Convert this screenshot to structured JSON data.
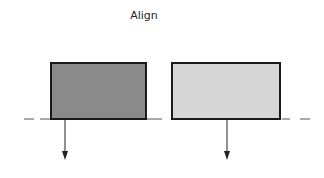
{
  "title": "Align",
  "diagram": {
    "baseline": {
      "y": 119,
      "x_start": 24,
      "x_end": 312,
      "style": "dashed"
    },
    "boxes": [
      {
        "name": "dark-box",
        "x": 51,
        "y": 63,
        "width": 95,
        "height": 56,
        "fill": "#8a8a8a",
        "stroke": "#1a1a1a"
      },
      {
        "name": "light-box",
        "x": 172,
        "y": 63,
        "width": 108,
        "height": 56,
        "fill": "#d6d6d6",
        "stroke": "#1a1a1a"
      }
    ],
    "arrows": [
      {
        "name": "left-arrow",
        "x": 65,
        "y1": 119,
        "y2": 160
      },
      {
        "name": "right-arrow",
        "x": 227,
        "y1": 119,
        "y2": 160
      }
    ]
  }
}
